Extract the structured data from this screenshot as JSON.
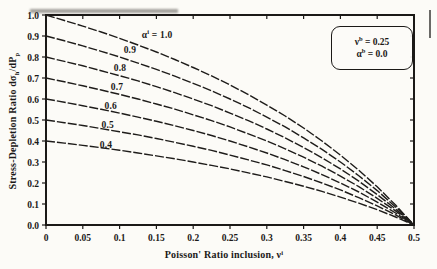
{
  "chart_data": {
    "type": "line",
    "title": "",
    "xlabel": "Poisson' Ratio inclusion, νⁱ",
    "ylabel": "Stress-Depletion Ratio dσₕ/dPₚ",
    "xlabel_parts": [
      {
        "t": "Poisson' Ratio inclusion, ν"
      },
      {
        "t": "i",
        "sup": true
      }
    ],
    "ylabel_parts": [
      {
        "t": "Stress-Depletion Ratio dσ"
      },
      {
        "t": "h",
        "sub": true
      },
      {
        "t": "/dP"
      },
      {
        "t": "p",
        "sub": true
      }
    ],
    "xlim": [
      0,
      0.5
    ],
    "ylim": [
      0.0,
      1.0
    ],
    "grid": false,
    "legend_position": "upper right",
    "x_ticks": [
      0,
      0.05,
      0.1,
      0.15,
      0.2,
      0.25,
      0.3,
      0.35,
      0.4,
      0.45,
      0.5
    ],
    "x_tick_labels": [
      "0",
      "0.05",
      "0.1",
      "0.15",
      "0.2",
      "0.25",
      "0.3",
      "0.35",
      "0.4",
      "0.45",
      "0.5"
    ],
    "y_ticks": [
      0,
      0.1,
      0.2,
      0.3,
      0.4,
      0.5,
      0.6,
      0.7,
      0.8,
      0.9,
      1.0
    ],
    "y_tick_labels": [
      "0.0",
      "0.1",
      "0.2",
      "0.3",
      "0.4",
      "0.5",
      "0.6",
      "0.7",
      "0.8",
      "0.9",
      "1.0"
    ],
    "x": [
      0,
      0.025,
      0.05,
      0.075,
      0.1,
      0.125,
      0.15,
      0.175,
      0.2,
      0.225,
      0.25,
      0.275,
      0.3,
      0.325,
      0.35,
      0.375,
      0.4,
      0.425,
      0.45,
      0.475,
      0.5
    ],
    "series": [
      {
        "name": "αⁱ = 1.0",
        "alpha": 1.0,
        "label": "αⁱ = 1.0",
        "label_parts": [
          {
            "t": "α"
          },
          {
            "t": "i",
            "sup": true
          },
          {
            "t": " = 1.0"
          }
        ],
        "label_x": 0.151,
        "label_y": 0.905,
        "values": [
          1.0,
          0.974,
          0.947,
          0.919,
          0.889,
          0.857,
          0.824,
          0.788,
          0.75,
          0.71,
          0.667,
          0.621,
          0.571,
          0.519,
          0.462,
          0.4,
          0.333,
          0.261,
          0.182,
          0.095,
          0.0
        ]
      },
      {
        "name": "αⁱ = 0.9",
        "alpha": 0.9,
        "label": "0.9",
        "label_parts": [
          {
            "t": "0.9"
          }
        ],
        "label_x": 0.114,
        "label_y": 0.833,
        "values": [
          0.9,
          0.877,
          0.853,
          0.827,
          0.8,
          0.771,
          0.741,
          0.709,
          0.675,
          0.639,
          0.6,
          0.559,
          0.514,
          0.467,
          0.415,
          0.36,
          0.3,
          0.235,
          0.164,
          0.086,
          0.0
        ]
      },
      {
        "name": "αⁱ = 0.8",
        "alpha": 0.8,
        "label": "0.8",
        "label_parts": [
          {
            "t": "0.8"
          }
        ],
        "label_x": 0.1005,
        "label_y": 0.748,
        "values": [
          0.8,
          0.779,
          0.758,
          0.735,
          0.711,
          0.686,
          0.659,
          0.63,
          0.6,
          0.568,
          0.533,
          0.497,
          0.457,
          0.415,
          0.369,
          0.32,
          0.267,
          0.209,
          0.145,
          0.076,
          0.0
        ]
      },
      {
        "name": "αⁱ = 0.7",
        "alpha": 0.7,
        "label": "0.7",
        "label_parts": [
          {
            "t": "0.7"
          }
        ],
        "label_x": 0.0965,
        "label_y": 0.657,
        "values": [
          0.7,
          0.682,
          0.663,
          0.643,
          0.622,
          0.6,
          0.576,
          0.552,
          0.525,
          0.497,
          0.467,
          0.434,
          0.4,
          0.363,
          0.323,
          0.28,
          0.233,
          0.183,
          0.127,
          0.067,
          0.0
        ]
      },
      {
        "name": "αⁱ = 0.6",
        "alpha": 0.6,
        "label": "0.6",
        "label_parts": [
          {
            "t": "0.6"
          }
        ],
        "label_x": 0.088,
        "label_y": 0.567,
        "values": [
          0.6,
          0.585,
          0.568,
          0.551,
          0.533,
          0.514,
          0.494,
          0.473,
          0.45,
          0.426,
          0.4,
          0.372,
          0.343,
          0.311,
          0.277,
          0.24,
          0.2,
          0.157,
          0.109,
          0.057,
          0.0
        ]
      },
      {
        "name": "αⁱ = 0.5",
        "alpha": 0.5,
        "label": "0.5",
        "label_parts": [
          {
            "t": "0.5"
          }
        ],
        "label_x": 0.084,
        "label_y": 0.476,
        "values": [
          0.5,
          0.487,
          0.474,
          0.459,
          0.444,
          0.429,
          0.412,
          0.394,
          0.375,
          0.355,
          0.333,
          0.31,
          0.286,
          0.259,
          0.231,
          0.2,
          0.167,
          0.13,
          0.091,
          0.048,
          0.0
        ]
      },
      {
        "name": "αⁱ = 0.4",
        "alpha": 0.4,
        "label": "0.4",
        "label_parts": [
          {
            "t": "0.4"
          }
        ],
        "label_x": 0.0815,
        "label_y": 0.381,
        "values": [
          0.4,
          0.39,
          0.379,
          0.368,
          0.356,
          0.343,
          0.329,
          0.315,
          0.3,
          0.284,
          0.267,
          0.248,
          0.229,
          0.207,
          0.185,
          0.16,
          0.133,
          0.104,
          0.073,
          0.038,
          0.0
        ]
      }
    ],
    "annotation_box": {
      "lines": [
        "νᵇ = 0.25",
        "αᵇ = 0.0"
      ],
      "lines_parts": [
        [
          {
            "t": "ν"
          },
          {
            "t": "b",
            "sup": true
          },
          {
            "t": " = 0.25"
          }
        ],
        [
          {
            "t": "α"
          },
          {
            "t": "b",
            "sup": true
          },
          {
            "t": " = 0.0"
          }
        ]
      ]
    },
    "colors": {
      "curve": "#1e1c1a",
      "axis": "#1b1917",
      "text": "#1b1917",
      "paper": "#fcfbf7"
    }
  }
}
